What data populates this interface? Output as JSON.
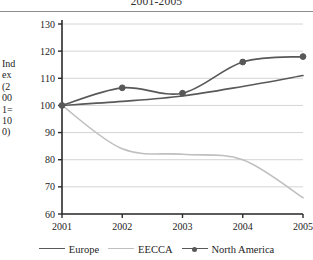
{
  "chart": {
    "title": "2001-2005",
    "ylabel_wrapped": "Ind\nex\n(2\n00\n1=\n10\n0)"
  },
  "colors": {
    "europe": "#595959",
    "eecca": "#bfbfbf",
    "north_america": "#585858",
    "gridline": "#d4d4d4",
    "axis": "#2b2b2b",
    "rule": "#8d8d8d"
  },
  "legend": {
    "items": [
      {
        "label": "Europe",
        "key": "europe"
      },
      {
        "label": "EECCA",
        "key": "eecca"
      },
      {
        "label": "North America",
        "key": "north_america"
      }
    ]
  },
  "chart_data": {
    "type": "line",
    "title": "2001-2005",
    "xlabel": "",
    "ylabel": "Index (2001=100)",
    "x": [
      "2001",
      "2002",
      "2003",
      "2004",
      "2005"
    ],
    "categories": [
      "2001",
      "2002",
      "2003",
      "2004",
      "2005"
    ],
    "xtick_labels": [
      "2001",
      "2002",
      "2003",
      "2004",
      "2005"
    ],
    "ytick_labels": [
      "60",
      "70",
      "80",
      "90",
      "100",
      "110",
      "120",
      "130"
    ],
    "yticks": [
      60,
      70,
      80,
      90,
      100,
      110,
      120,
      130
    ],
    "ylim": [
      60,
      130
    ],
    "grid": "horizontal",
    "legend_position": "bottom",
    "smoothing": "spline",
    "series": [
      {
        "name": "Europe",
        "color": "#595959",
        "markers": false,
        "values": [
          100,
          101.5,
          103.5,
          107,
          111
        ]
      },
      {
        "name": "EECCA",
        "color": "#bfbfbf",
        "markers": false,
        "values": [
          100,
          84,
          82,
          80,
          66
        ]
      },
      {
        "name": "North America",
        "color": "#585858",
        "markers": true,
        "values": [
          100,
          106.5,
          104.5,
          116,
          118
        ]
      }
    ]
  }
}
